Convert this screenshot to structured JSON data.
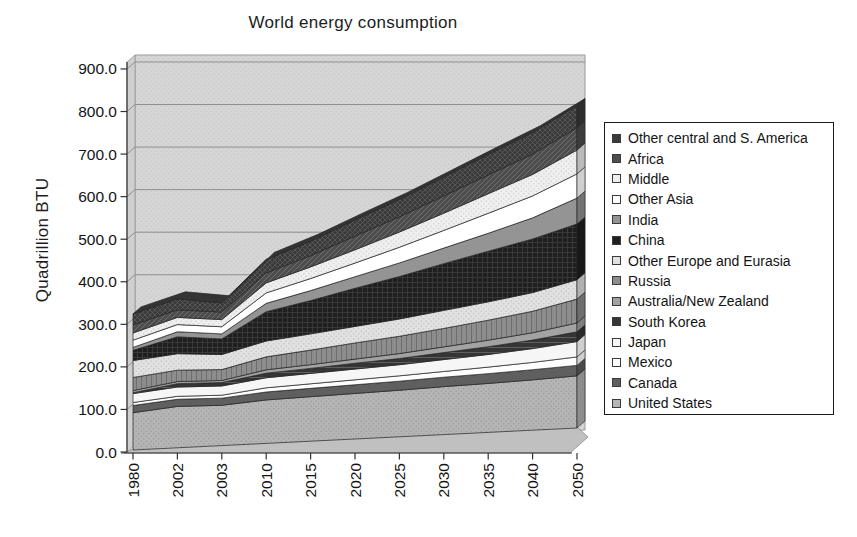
{
  "title": "World energy consumption",
  "y_axis": {
    "label": "Quadrillion BTU",
    "ticks": [
      "900.0",
      "800.0",
      "700.0",
      "600.0",
      "500.0",
      "400.0",
      "300.0",
      "200.0",
      "100.0",
      "0.0"
    ]
  },
  "x_axis": {
    "categories": [
      "1980",
      "2002",
      "2003",
      "2010",
      "2015",
      "2020",
      "2025",
      "2030",
      "2035",
      "2040",
      "2050"
    ]
  },
  "colors": {
    "wall": "#d6d6d6",
    "wall_dots": "#c7c7c7",
    "wall_edge": "#9a9a9a",
    "gridline": "#8f8f8f",
    "floor": "#c0c0c0",
    "axis": "#333333",
    "band_outline": "#222222"
  },
  "legend_order": "top of stack listed first",
  "chart_data": {
    "type": "area",
    "stacked": true,
    "projection": "pseudo-3d",
    "title": "World energy consumption",
    "ylabel": "Quadrillion BTU",
    "ylim": [
      0,
      900
    ],
    "y_step": 100,
    "grid": true,
    "legend_position": "right",
    "x": [
      1980,
      2002,
      2003,
      2010,
      2015,
      2020,
      2025,
      2030,
      2035,
      2040,
      2050
    ],
    "series": [
      {
        "name": "United States",
        "color": "#b5b5b5",
        "pattern": "dots",
        "pattern_color": "#9b9b9b",
        "values": [
          88,
          98,
          96,
          104,
          107,
          110,
          113,
          117,
          120,
          124,
          129
        ]
      },
      {
        "name": "Canada",
        "color": "#5f5f5f",
        "pattern": "none",
        "pattern_color": "#5f5f5f",
        "values": [
          17,
          17,
          17,
          19,
          20,
          21,
          22,
          23,
          24,
          25,
          26
        ]
      },
      {
        "name": "Mexico",
        "color": "#fdfdfd",
        "pattern": "none",
        "pattern_color": "#fdfdfd",
        "values": [
          7,
          7,
          7,
          10,
          11,
          12,
          13,
          14,
          16,
          18,
          21
        ]
      },
      {
        "name": "Japan",
        "color": "#f6f6f6",
        "pattern": "none",
        "pattern_color": "#f6f6f6",
        "values": [
          21,
          22,
          22,
          24,
          25,
          26,
          27,
          29,
          31,
          34,
          38
        ]
      },
      {
        "name": "South Korea",
        "color": "#353535",
        "pattern": "hlines",
        "pattern_color": "#5f5f5f",
        "values": [
          2,
          8,
          8,
          11,
          12,
          14,
          15,
          17,
          19,
          21,
          24
        ]
      },
      {
        "name": "Australia/New Zealand",
        "color": "#a2a2a2",
        "pattern": "none",
        "pattern_color": "#a2a2a2",
        "values": [
          5,
          5,
          5,
          8,
          9,
          10,
          12,
          14,
          16,
          18,
          22
        ]
      },
      {
        "name": "Russia",
        "color": "#8d8d8d",
        "pattern": "vlines",
        "pattern_color": "#6e6e6e",
        "values": [
          31,
          27,
          26,
          31,
          35,
          39,
          42,
          45,
          49,
          53,
          59
        ]
      },
      {
        "name": "Other Europe and Eurasia",
        "color": "#e1e1e1",
        "pattern": "dots",
        "pattern_color": "#c4c4c4",
        "values": [
          40,
          39,
          36,
          38,
          39,
          40,
          42,
          44,
          45,
          46,
          48
        ]
      },
      {
        "name": "China",
        "color": "#1f1f1f",
        "pattern": "weave",
        "pattern_color": "#3f3f3f",
        "values": [
          24,
          40,
          37,
          70,
          80,
          92,
          103,
          114,
          124,
          132,
          138
        ]
      },
      {
        "name": "India",
        "color": "#949494",
        "pattern": "none",
        "pattern_color": "#949494",
        "values": [
          7,
          12,
          12,
          20,
          24,
          28,
          33,
          38,
          44,
          52,
          64
        ]
      },
      {
        "name": "Other Asia",
        "color": "#ffffff",
        "pattern": "none",
        "pattern_color": "#ffffff",
        "values": [
          17,
          17,
          17,
          25,
          29,
          33,
          38,
          43,
          49,
          54,
          60
        ]
      },
      {
        "name": "Middle",
        "color": "#efefef",
        "pattern": "dots",
        "pattern_color": "#d2d2d2",
        "values": [
          17,
          17,
          17,
          24,
          28,
          32,
          37,
          42,
          48,
          53,
          59
        ]
      },
      {
        "name": "Africa",
        "color": "#4d4d4d",
        "pattern": "diag",
        "pattern_color": "#6f6f6f",
        "values": [
          19,
          18,
          18,
          24,
          27,
          33,
          37,
          42,
          46,
          50,
          55
        ]
      },
      {
        "name": "Other central and S. America",
        "color": "#3a3a3a",
        "pattern": "cross",
        "pattern_color": "#5d5d5d",
        "values": [
          26,
          26,
          22,
          32,
          35,
          39,
          42,
          46,
          50,
          53,
          55
        ]
      }
    ]
  }
}
